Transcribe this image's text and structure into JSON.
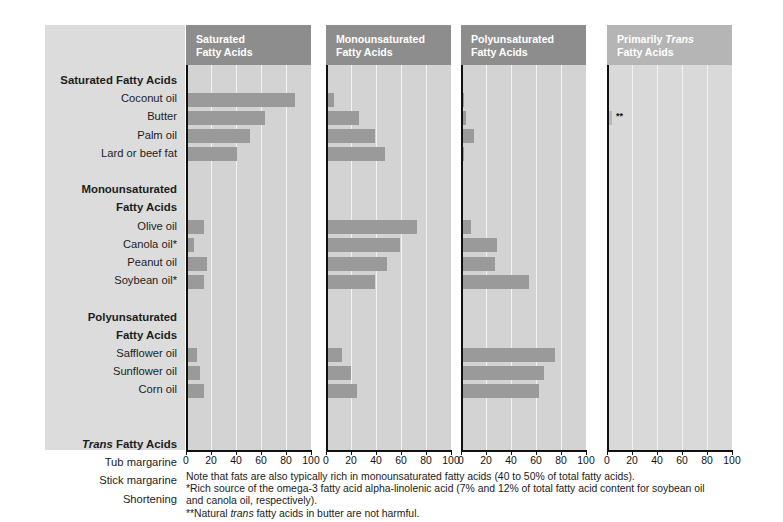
{
  "chart_data": {
    "type": "bar",
    "title": "",
    "subtitle": "",
    "xlabel": "",
    "ylabel": "",
    "xlim": [
      0,
      100
    ],
    "xticks": [
      0,
      20,
      40,
      60,
      80,
      100
    ],
    "grid": true,
    "orientation": "horizontal",
    "panels": [
      {
        "key": "saturated",
        "label_line1": "Saturated",
        "label_line2": "Fatty Acids",
        "italic_word": "",
        "shade": "dark"
      },
      {
        "key": "monounsaturated",
        "label_line1": "Monounsaturated",
        "label_line2": "Fatty Acids",
        "italic_word": "",
        "shade": "dark"
      },
      {
        "key": "polyunsaturated",
        "label_line1": "Polyunsaturated",
        "label_line2": "Fatty Acids",
        "italic_word": "",
        "shade": "dark"
      },
      {
        "key": "trans",
        "label_line1": "Primarily ",
        "label_line2": "Fatty Acids",
        "italic_word": "Trans",
        "shade": "light"
      }
    ],
    "groups": [
      {
        "heading": "Saturated Fatty Acids",
        "heading_italic": "",
        "items": [
          {
            "name": "Coconut oil",
            "saturated": 87,
            "monounsaturated": 6,
            "polyunsaturated": 2,
            "trans": 0
          },
          {
            "name": "Butter",
            "saturated": 63,
            "monounsaturated": 26,
            "polyunsaturated": 4,
            "trans": 4,
            "trans_note": "**"
          },
          {
            "name": "Palm oil",
            "saturated": 51,
            "monounsaturated": 39,
            "polyunsaturated": 10,
            "trans": 0
          },
          {
            "name": "Lard or beef fat",
            "saturated": 41,
            "monounsaturated": 47,
            "polyunsaturated": 2,
            "trans": 0
          }
        ]
      },
      {
        "heading": "Monounsaturated Fatty Acids",
        "heading_italic": "",
        "items": [
          {
            "name": "Olive oil",
            "saturated": 14,
            "monounsaturated": 73,
            "polyunsaturated": 8,
            "trans": 0
          },
          {
            "name": "Canola oil*",
            "saturated": 6,
            "monounsaturated": 59,
            "polyunsaturated": 29,
            "trans": 0
          },
          {
            "name": "Peanut oil",
            "saturated": 17,
            "monounsaturated": 49,
            "polyunsaturated": 27,
            "trans": 0
          },
          {
            "name": "Soybean oil*",
            "saturated": 14,
            "monounsaturated": 39,
            "polyunsaturated": 54,
            "trans": 0
          }
        ]
      },
      {
        "heading": "Polyunsaturated Fatty Acids",
        "heading_italic": "",
        "items": [
          {
            "name": "Safflower oil",
            "saturated": 9,
            "monounsaturated": 13,
            "polyunsaturated": 75,
            "trans": 0
          },
          {
            "name": "Sunflower oil",
            "saturated": 11,
            "monounsaturated": 20,
            "polyunsaturated": 66,
            "trans": 0
          },
          {
            "name": "Corn oil",
            "saturated": 14,
            "monounsaturated": 25,
            "polyunsaturated": 62,
            "trans": 0
          }
        ]
      },
      {
        "heading": " Fatty Acids",
        "heading_italic": "Trans",
        "items": [
          {
            "name": "Tub margarine",
            "saturated": 11,
            "monounsaturated": 20,
            "polyunsaturated": 42,
            "trans": 4
          },
          {
            "name": "Stick margarine",
            "saturated": 13,
            "monounsaturated": 17,
            "polyunsaturated": 29,
            "trans": 12
          },
          {
            "name": "Shortening",
            "saturated": 19,
            "monounsaturated": 11,
            "polyunsaturated": 14,
            "trans": 15
          }
        ]
      }
    ],
    "colors": {
      "bar": "#9a9a9a",
      "bar_light": "#b9b9b9",
      "panel_bg": "#d3d3d3",
      "panel_bg_light": "#d9d9d9",
      "header_bg": "#8d8d8d",
      "header_bg_light": "#b5b5b5",
      "label_col_bg": "#dcdcdc",
      "gridline": "#f3f3f3",
      "axis": "#111111"
    }
  },
  "footnotes": {
    "line1": "Note that fats are also typically rich in monounsaturated fatty acids (40 to 50% of total fatty acids).",
    "line2": "*Rich source of the omega-3 fatty acid alpha-linolenic acid (7% and 12% of total fatty acid content for soybean oil",
    "line3": "and canola oil, respectively).",
    "line4_pre": "**Natural ",
    "line4_italic": "trans",
    "line4_post": " fatty acids in butter are not harmful."
  }
}
